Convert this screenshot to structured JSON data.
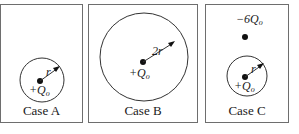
{
  "figure": {
    "panels": [
      {
        "id": "A",
        "caption": "Case A",
        "charge_label": "+Q",
        "charge_sub": "o",
        "radius_label": "r"
      },
      {
        "id": "B",
        "caption": "Case B",
        "charge_label": "+Q",
        "charge_sub": "o",
        "radius_label": "2r"
      },
      {
        "id": "C",
        "caption": "Case C",
        "charge_label": "+Q",
        "charge_sub": "o",
        "radius_label": "r",
        "external_charge_label": "−6Q",
        "external_charge_sub": "o"
      }
    ]
  }
}
